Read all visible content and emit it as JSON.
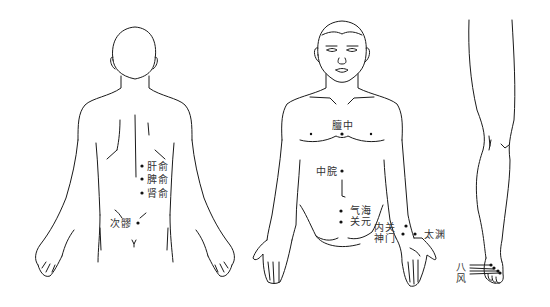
{
  "figures": {
    "back": {
      "view": "back",
      "points": [
        {
          "name": "ganshu",
          "label": "肝俞",
          "x": 142,
          "y": 166
        },
        {
          "name": "pishu",
          "label": "脾俞",
          "x": 142,
          "y": 179
        },
        {
          "name": "shenshu",
          "label": "肾俞",
          "x": 142,
          "y": 193
        },
        {
          "name": "ciliao",
          "label": "次髎",
          "x": 138,
          "y": 223
        }
      ]
    },
    "front": {
      "view": "front",
      "points": [
        {
          "name": "danzhong",
          "label": "膻中",
          "x": 342,
          "y": 134
        },
        {
          "name": "zhongwan",
          "label": "中脘",
          "x": 342,
          "y": 170
        },
        {
          "name": "qihai",
          "label": "气海",
          "x": 341,
          "y": 211
        },
        {
          "name": "guanyuan",
          "label": "关元",
          "x": 341,
          "y": 222
        },
        {
          "name": "neiguan",
          "label": "内关",
          "x": 405,
          "y": 233
        },
        {
          "name": "shenmen",
          "label": "神门",
          "x": 403,
          "y": 235
        },
        {
          "name": "taiyuan",
          "label": "太渊",
          "x": 415,
          "y": 234
        }
      ]
    },
    "leg": {
      "view": "leg",
      "points": [
        {
          "name": "bafeng",
          "label": "八风",
          "x": 488,
          "y": 269
        }
      ]
    }
  }
}
